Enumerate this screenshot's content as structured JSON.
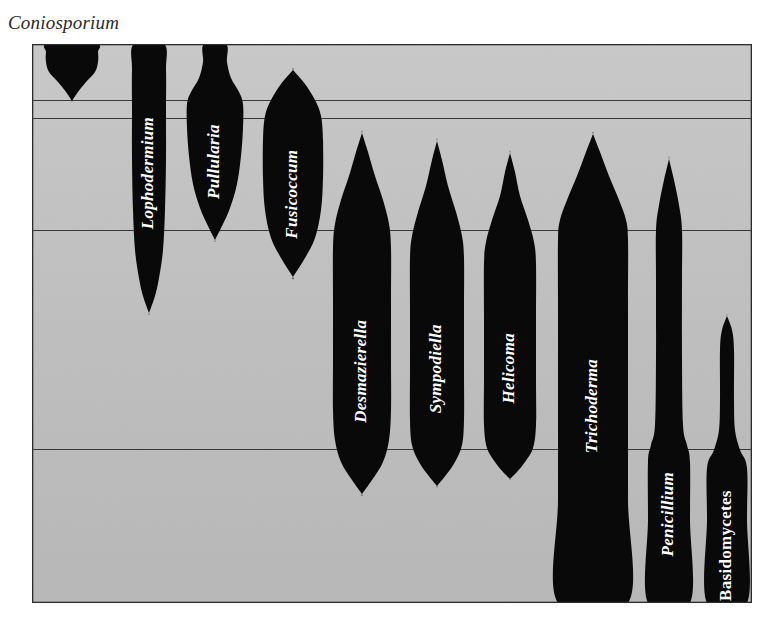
{
  "figure": {
    "title": "Coniosporium",
    "background_color": "#c9c9c9",
    "shape_color": "#090909",
    "label_color": "#ffffff",
    "frame_color": "#2b2b2b",
    "gridline_color": "#3a3a3a"
  },
  "plot": {
    "x": 32,
    "y": 44,
    "width": 720,
    "height": 559,
    "gridlines_y": [
      100,
      118,
      230,
      449
    ]
  },
  "chart_data": {
    "type": "area",
    "title": "Coniosporium",
    "xlabel": "",
    "ylabel": "",
    "orientation": "vertical-violin",
    "grid": true,
    "legend": false,
    "gridlines_y": [
      100,
      118,
      230,
      449
    ],
    "axis_top": 44,
    "axis_bottom": 603,
    "categories": [
      "Coniosporium",
      "Lophodermium",
      "Pullularia",
      "Fusicoccum",
      "Desmazierella",
      "Sympodiella",
      "Helicoma",
      "Trichoderma",
      "Penicillium",
      "Basidomycetes"
    ],
    "series": [
      {
        "name": "Coniosporium",
        "label": "Coniosporium",
        "label_style": "italic",
        "label_placement": "above-plot",
        "center_x": 72,
        "top": 44,
        "bottom": 101,
        "max_half_width": 26,
        "profile": [
          {
            "y": 44,
            "half_width": 24
          },
          {
            "y": 52,
            "half_width": 26
          },
          {
            "y": 62,
            "half_width": 26
          },
          {
            "y": 72,
            "half_width": 23
          },
          {
            "y": 82,
            "half_width": 14
          },
          {
            "y": 92,
            "half_width": 6
          },
          {
            "y": 101,
            "half_width": 0
          }
        ]
      },
      {
        "name": "Lophodermium",
        "label": "Lophodermium",
        "label_style": "italic",
        "label_placement": "inside",
        "center_x": 149,
        "top": 44,
        "bottom": 313,
        "max_half_width": 17,
        "profile": [
          {
            "y": 44,
            "half_width": 15
          },
          {
            "y": 70,
            "half_width": 17
          },
          {
            "y": 110,
            "half_width": 17
          },
          {
            "y": 160,
            "half_width": 17
          },
          {
            "y": 210,
            "half_width": 16
          },
          {
            "y": 250,
            "half_width": 14
          },
          {
            "y": 278,
            "half_width": 10
          },
          {
            "y": 296,
            "half_width": 6
          },
          {
            "y": 313,
            "half_width": 0
          }
        ]
      },
      {
        "name": "Pullularia",
        "label": "Pullularia",
        "label_style": "italic",
        "label_placement": "inside",
        "center_x": 215,
        "top": 44,
        "bottom": 240,
        "max_half_width": 28,
        "profile": [
          {
            "y": 44,
            "half_width": 11
          },
          {
            "y": 62,
            "half_width": 12
          },
          {
            "y": 78,
            "half_width": 16
          },
          {
            "y": 92,
            "half_width": 24
          },
          {
            "y": 104,
            "half_width": 28
          },
          {
            "y": 128,
            "half_width": 28
          },
          {
            "y": 156,
            "half_width": 26
          },
          {
            "y": 184,
            "half_width": 22
          },
          {
            "y": 208,
            "half_width": 15
          },
          {
            "y": 226,
            "half_width": 7
          },
          {
            "y": 240,
            "half_width": 0
          }
        ]
      },
      {
        "name": "Fusicoccum",
        "label": "Fusicoccum",
        "label_style": "italic",
        "label_placement": "inside",
        "center_x": 293,
        "top": 70,
        "bottom": 277,
        "max_half_width": 30,
        "profile": [
          {
            "y": 70,
            "half_width": 0
          },
          {
            "y": 84,
            "half_width": 12
          },
          {
            "y": 100,
            "half_width": 22
          },
          {
            "y": 116,
            "half_width": 28
          },
          {
            "y": 140,
            "half_width": 30
          },
          {
            "y": 178,
            "half_width": 30
          },
          {
            "y": 210,
            "half_width": 28
          },
          {
            "y": 238,
            "half_width": 22
          },
          {
            "y": 258,
            "half_width": 12
          },
          {
            "y": 277,
            "half_width": 0
          }
        ]
      },
      {
        "name": "Desmazierella",
        "label": "Desmazierella",
        "label_style": "italic",
        "label_placement": "inside",
        "center_x": 362,
        "top": 133,
        "bottom": 494,
        "max_half_width": 29,
        "profile": [
          {
            "y": 133,
            "half_width": 0
          },
          {
            "y": 152,
            "half_width": 6
          },
          {
            "y": 176,
            "half_width": 13
          },
          {
            "y": 200,
            "half_width": 21
          },
          {
            "y": 224,
            "half_width": 27
          },
          {
            "y": 248,
            "half_width": 29
          },
          {
            "y": 300,
            "half_width": 29
          },
          {
            "y": 360,
            "half_width": 29
          },
          {
            "y": 410,
            "half_width": 29
          },
          {
            "y": 440,
            "half_width": 27
          },
          {
            "y": 462,
            "half_width": 21
          },
          {
            "y": 480,
            "half_width": 10
          },
          {
            "y": 494,
            "half_width": 0
          }
        ]
      },
      {
        "name": "Sympodiella",
        "label": "Sympodiella",
        "label_style": "italic",
        "label_placement": "inside",
        "center_x": 437,
        "top": 141,
        "bottom": 486,
        "max_half_width": 27,
        "profile": [
          {
            "y": 141,
            "half_width": 0
          },
          {
            "y": 160,
            "half_width": 5
          },
          {
            "y": 186,
            "half_width": 11
          },
          {
            "y": 212,
            "half_width": 19
          },
          {
            "y": 236,
            "half_width": 25
          },
          {
            "y": 258,
            "half_width": 27
          },
          {
            "y": 310,
            "half_width": 27
          },
          {
            "y": 370,
            "half_width": 27
          },
          {
            "y": 420,
            "half_width": 27
          },
          {
            "y": 445,
            "half_width": 25
          },
          {
            "y": 462,
            "half_width": 18
          },
          {
            "y": 475,
            "half_width": 9
          },
          {
            "y": 486,
            "half_width": 0
          }
        ]
      },
      {
        "name": "Helicoma",
        "label": "Helicoma",
        "label_style": "italic",
        "label_placement": "inside",
        "center_x": 510,
        "top": 153,
        "bottom": 479,
        "max_half_width": 26,
        "profile": [
          {
            "y": 153,
            "half_width": 0
          },
          {
            "y": 172,
            "half_width": 5
          },
          {
            "y": 196,
            "half_width": 10
          },
          {
            "y": 220,
            "half_width": 18
          },
          {
            "y": 242,
            "half_width": 24
          },
          {
            "y": 264,
            "half_width": 26
          },
          {
            "y": 320,
            "half_width": 26
          },
          {
            "y": 380,
            "half_width": 26
          },
          {
            "y": 425,
            "half_width": 26
          },
          {
            "y": 448,
            "half_width": 23
          },
          {
            "y": 462,
            "half_width": 15
          },
          {
            "y": 472,
            "half_width": 7
          },
          {
            "y": 479,
            "half_width": 0
          }
        ]
      },
      {
        "name": "Trichoderma",
        "label": "Trichoderma",
        "label_style": "italic",
        "label_placement": "inside",
        "center_x": 593,
        "top": 134,
        "bottom": 603,
        "max_half_width": 35,
        "profile": [
          {
            "y": 134,
            "half_width": 0
          },
          {
            "y": 152,
            "half_width": 7
          },
          {
            "y": 176,
            "half_width": 16
          },
          {
            "y": 200,
            "half_width": 26
          },
          {
            "y": 220,
            "half_width": 33
          },
          {
            "y": 240,
            "half_width": 35
          },
          {
            "y": 300,
            "half_width": 35
          },
          {
            "y": 400,
            "half_width": 35
          },
          {
            "y": 500,
            "half_width": 35
          },
          {
            "y": 603,
            "half_width": 35
          }
        ]
      },
      {
        "name": "Penicillium",
        "label": "Penicillium",
        "label_style": "italic",
        "label_placement": "inside",
        "center_x": 669,
        "top": 159,
        "bottom": 603,
        "max_half_width": 21,
        "profile": [
          {
            "y": 159,
            "half_width": 0
          },
          {
            "y": 180,
            "half_width": 5
          },
          {
            "y": 205,
            "half_width": 10
          },
          {
            "y": 230,
            "half_width": 13
          },
          {
            "y": 280,
            "half_width": 13
          },
          {
            "y": 360,
            "half_width": 13
          },
          {
            "y": 425,
            "half_width": 14
          },
          {
            "y": 445,
            "half_width": 18
          },
          {
            "y": 462,
            "half_width": 21
          },
          {
            "y": 520,
            "half_width": 21
          },
          {
            "y": 603,
            "half_width": 21
          }
        ]
      },
      {
        "name": "Basidomycetes",
        "label": "Basidomycetes",
        "label_style": "upright",
        "label_placement": "inside",
        "center_x": 727,
        "top": 316,
        "bottom": 603,
        "max_half_width": 20,
        "profile": [
          {
            "y": 316,
            "half_width": 0
          },
          {
            "y": 330,
            "half_width": 5
          },
          {
            "y": 350,
            "half_width": 7
          },
          {
            "y": 400,
            "half_width": 7
          },
          {
            "y": 430,
            "half_width": 8
          },
          {
            "y": 450,
            "half_width": 13
          },
          {
            "y": 468,
            "half_width": 20
          },
          {
            "y": 520,
            "half_width": 20
          },
          {
            "y": 603,
            "half_width": 20
          }
        ]
      }
    ]
  }
}
